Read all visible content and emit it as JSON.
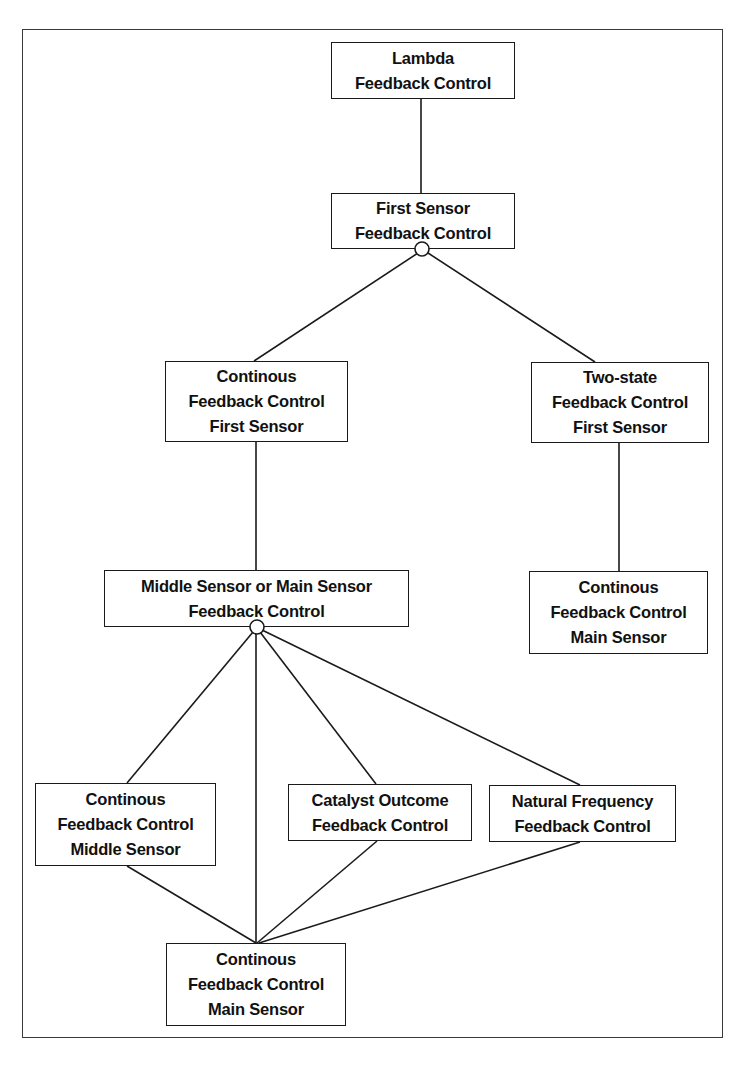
{
  "diagram": {
    "type": "feature-tree",
    "nodes": [
      {
        "id": "lambda",
        "lines": [
          "Lambda",
          "Feedback Control"
        ],
        "box": {
          "x": 331,
          "y": 42,
          "w": 184,
          "h": 57
        }
      },
      {
        "id": "first-sensor",
        "lines": [
          "First Sensor",
          "Feedback Control"
        ],
        "box": {
          "x": 331,
          "y": 193,
          "w": 184,
          "h": 56
        }
      },
      {
        "id": "continous-first-sensor",
        "lines": [
          "Continous",
          "Feedback Control",
          "First Sensor"
        ],
        "box": {
          "x": 165,
          "y": 361,
          "w": 183,
          "h": 81
        }
      },
      {
        "id": "two-state-first-sensor",
        "lines": [
          "Two-state",
          "Feedback Control",
          "First Sensor"
        ],
        "box": {
          "x": 531,
          "y": 362,
          "w": 178,
          "h": 81
        }
      },
      {
        "id": "middle-or-main-sensor",
        "lines": [
          "Middle Sensor or Main Sensor",
          "Feedback Control"
        ],
        "box": {
          "x": 104,
          "y": 570,
          "w": 305,
          "h": 57
        }
      },
      {
        "id": "continous-main-sensor-right",
        "lines": [
          "Continous",
          "Feedback Control",
          "Main Sensor"
        ],
        "box": {
          "x": 529,
          "y": 571,
          "w": 179,
          "h": 83
        }
      },
      {
        "id": "continous-middle-sensor",
        "lines": [
          "Continous",
          "Feedback Control",
          "Middle Sensor"
        ],
        "box": {
          "x": 35,
          "y": 783,
          "w": 181,
          "h": 83
        }
      },
      {
        "id": "catalyst-outcome",
        "lines": [
          "Catalyst Outcome",
          "Feedback Control"
        ],
        "box": {
          "x": 288,
          "y": 784,
          "w": 184,
          "h": 57
        }
      },
      {
        "id": "natural-frequency",
        "lines": [
          "Natural Frequency",
          "Feedback Control"
        ],
        "box": {
          "x": 489,
          "y": 785,
          "w": 187,
          "h": 57
        }
      },
      {
        "id": "continous-main-sensor-bottom",
        "lines": [
          "Continous",
          "Feedback Control",
          "Main Sensor"
        ],
        "box": {
          "x": 166,
          "y": 943,
          "w": 180,
          "h": 83
        }
      }
    ],
    "edges": [
      {
        "from": "lambda",
        "to": "first-sensor",
        "x1": 421,
        "y1": 99,
        "x2": 421,
        "y2": 193
      },
      {
        "from": "first-sensor",
        "to": "continous-first-sensor",
        "x1": 418,
        "y1": 253,
        "x2": 254,
        "y2": 361
      },
      {
        "from": "first-sensor",
        "to": "two-state-first-sensor",
        "x1": 428,
        "y1": 253,
        "x2": 595,
        "y2": 362
      },
      {
        "from": "continous-first-sensor",
        "to": "middle-or-main-sensor",
        "x1": 256,
        "y1": 442,
        "x2": 256,
        "y2": 570
      },
      {
        "from": "two-state-first-sensor",
        "to": "continous-main-sensor-right",
        "x1": 619,
        "y1": 443,
        "x2": 619,
        "y2": 571
      },
      {
        "from": "middle-or-main-sensor",
        "to": "continous-middle-sensor",
        "x1": 253,
        "y1": 632,
        "x2": 127,
        "y2": 783
      },
      {
        "from": "middle-or-main-sensor",
        "to": "continous-main-sensor-bottom",
        "x1": 256,
        "y1": 634,
        "x2": 256,
        "y2": 943
      },
      {
        "from": "middle-or-main-sensor",
        "to": "catalyst-outcome",
        "x1": 260,
        "y1": 632,
        "x2": 376,
        "y2": 784
      },
      {
        "from": "middle-or-main-sensor",
        "to": "natural-frequency",
        "x1": 262,
        "y1": 630,
        "x2": 580,
        "y2": 785
      },
      {
        "from": "continous-middle-sensor",
        "to": "continous-main-sensor-bottom",
        "x1": 127,
        "y1": 866,
        "x2": 256,
        "y2": 943
      },
      {
        "from": "catalyst-outcome",
        "to": "continous-main-sensor-bottom",
        "x1": 377,
        "y1": 841,
        "x2": 257,
        "y2": 943
      },
      {
        "from": "natural-frequency",
        "to": "continous-main-sensor-bottom",
        "x1": 580,
        "y1": 842,
        "x2": 259,
        "y2": 943
      }
    ],
    "alternative_markers": [
      {
        "at": "first-sensor",
        "cx": 422,
        "cy": 249,
        "r": 7
      },
      {
        "at": "middle-or-main-sensor",
        "cx": 257,
        "cy": 627,
        "r": 7
      }
    ],
    "colors": {
      "stroke": "#1a1a1a",
      "frame": "#3a3a3a",
      "background": "#ffffff",
      "text": "#111111"
    }
  }
}
